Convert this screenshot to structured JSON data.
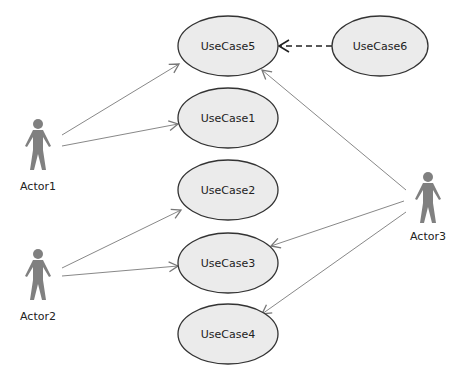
{
  "diagram": {
    "type": "use-case",
    "colors": {
      "usecase_fill": "#ebebeb",
      "usecase_stroke": "#333333",
      "actor_fill": "#808080",
      "edge": "#888888",
      "dependency": "#222222"
    },
    "actors": [
      {
        "id": "actor1",
        "label": "Actor1"
      },
      {
        "id": "actor2",
        "label": "Actor2"
      },
      {
        "id": "actor3",
        "label": "Actor3"
      }
    ],
    "usecases": [
      {
        "id": "uc5",
        "label": "UseCase5"
      },
      {
        "id": "uc6",
        "label": "UseCase6"
      },
      {
        "id": "uc1",
        "label": "UseCase1"
      },
      {
        "id": "uc2",
        "label": "UseCase2"
      },
      {
        "id": "uc3",
        "label": "UseCase3"
      },
      {
        "id": "uc4",
        "label": "UseCase4"
      }
    ],
    "associations": [
      {
        "from": "Actor1",
        "to": "UseCase5"
      },
      {
        "from": "Actor1",
        "to": "UseCase1"
      },
      {
        "from": "Actor2",
        "to": "UseCase2"
      },
      {
        "from": "Actor2",
        "to": "UseCase3"
      },
      {
        "from": "Actor3",
        "to": "UseCase5"
      },
      {
        "from": "Actor3",
        "to": "UseCase3"
      },
      {
        "from": "Actor3",
        "to": "UseCase4"
      }
    ],
    "dependencies": [
      {
        "from": "UseCase6",
        "to": "UseCase5",
        "style": "dashed"
      }
    ]
  }
}
